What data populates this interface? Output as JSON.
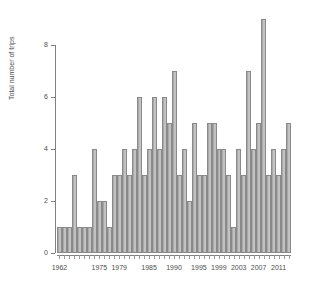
{
  "chart_data": {
    "type": "bar",
    "title": "",
    "xlabel": "",
    "ylabel": "Total number of trips",
    "ylim": [
      0,
      9
    ],
    "yticks": [
      0,
      2,
      4,
      6,
      8
    ],
    "ytick_labels": [
      "0",
      "2",
      "4",
      "6",
      "8"
    ],
    "grid": false,
    "legend": null,
    "xtick_labels": [
      "1962",
      "1975",
      "1979",
      "1985",
      "1990",
      "1995",
      "1999",
      "2003",
      "2007",
      "2011"
    ],
    "xtick_positions": [
      0,
      8,
      12,
      18,
      23,
      28,
      32,
      36,
      40,
      44
    ],
    "categories": [
      "1962",
      "1963",
      "1964",
      "1965",
      "1966",
      "1967",
      "1968",
      "1975",
      "1976",
      "1977",
      "1978",
      "1979",
      "1980",
      "1981",
      "1982",
      "1983",
      "1985",
      "1986",
      "1987",
      "1988",
      "1989",
      "1990",
      "1991",
      "1992",
      "1993",
      "1994",
      "1995",
      "1996",
      "1997",
      "1998",
      "1999",
      "2000",
      "2001",
      "2002",
      "2003",
      "2004",
      "2005",
      "2006",
      "2007",
      "2008",
      "2009",
      "2010",
      "2011",
      "2012",
      "2013",
      "2014",
      "2015"
    ],
    "values": [
      1,
      1,
      1,
      3,
      1,
      1,
      1,
      4,
      2,
      2,
      1,
      3,
      3,
      4,
      3,
      4,
      6,
      3,
      4,
      6,
      4,
      6,
      5,
      7,
      3,
      4,
      2,
      5,
      3,
      3,
      5,
      5,
      4,
      4,
      3,
      1,
      4,
      3,
      7,
      4,
      5,
      9,
      3,
      4,
      3,
      4,
      5
    ],
    "bar_color": "#b8b8b8",
    "bar_edge_color": "#8a8a8a"
  }
}
